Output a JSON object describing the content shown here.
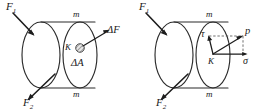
{
  "figure": {
    "background_color": "#ffffff",
    "line_color": "#2b2b2b",
    "panels": [
      {
        "id": "left-panel",
        "name": "delta-force-panel",
        "labels": {
          "force_top": "F",
          "force_top_sub": "1",
          "force_bottom": "F",
          "force_bottom_sub": "2",
          "section_top": "m",
          "section_bottom": "m",
          "point": "K",
          "delta_force": "ΔF",
          "delta_area": "ΔA"
        }
      },
      {
        "id": "right-panel",
        "name": "stress-components-panel",
        "labels": {
          "force_top": "F",
          "force_top_sub": "1",
          "force_bottom": "F",
          "force_bottom_sub": "2",
          "section_top": "m",
          "section_bottom": "m",
          "point": "K",
          "total_stress": "p",
          "shear_stress": "τ",
          "normal_stress": "σ"
        }
      }
    ]
  }
}
